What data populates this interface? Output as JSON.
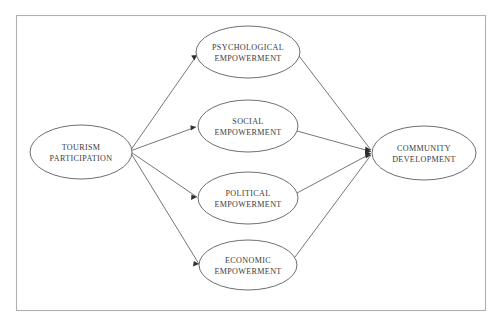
{
  "diagram": {
    "type": "conceptual-path-model",
    "frame": {
      "visible": true,
      "border_color": "#b0b0b0"
    },
    "colors": {
      "background": "#ffffff",
      "node_stroke": "#5d5d5d",
      "link_stroke": "#5d5d5d",
      "arrow_fill": "#2f2f2f",
      "text": "#3b3b3b"
    },
    "nodes": [
      {
        "id": "tourism-participation",
        "role": "independent-variable",
        "line1": "TOURISM",
        "line2": "PARTICIPATION",
        "cx": 81,
        "cy": 152,
        "rx": 51,
        "ry": 27
      },
      {
        "id": "psychological-empowerment",
        "role": "mediator",
        "line1": "PSYCHOLOGICAL",
        "line2": "EMPOWERMENT",
        "cx": 248,
        "cy": 52,
        "rx": 52,
        "ry": 26
      },
      {
        "id": "social-empowerment",
        "role": "mediator",
        "line1": "SOCIAL",
        "line2": "EMPOWERMENT",
        "cx": 248,
        "cy": 126,
        "rx": 50,
        "ry": 26
      },
      {
        "id": "political-empowerment",
        "role": "mediator",
        "line1": "POLITICAL",
        "line2": "EMPOWERMENT",
        "cx": 248,
        "cy": 198,
        "rx": 50,
        "ry": 26
      },
      {
        "id": "economic-empowerment",
        "role": "mediator",
        "line1": "ECONOMIC",
        "line2": "EMPOWERMENT",
        "cx": 248,
        "cy": 265,
        "rx": 49,
        "ry": 25
      },
      {
        "id": "community-development",
        "role": "dependent-variable",
        "line1": "COMMUNITY",
        "line2": "DEVELOPMENT",
        "cx": 424,
        "cy": 153,
        "rx": 52,
        "ry": 27
      }
    ],
    "links": [
      {
        "id": "tp-to-psychological",
        "from": "tourism-participation",
        "to": "psychological-empowerment"
      },
      {
        "id": "tp-to-social",
        "from": "tourism-participation",
        "to": "social-empowerment"
      },
      {
        "id": "tp-to-political",
        "from": "tourism-participation",
        "to": "political-empowerment"
      },
      {
        "id": "tp-to-economic",
        "from": "tourism-participation",
        "to": "economic-empowerment"
      },
      {
        "id": "psychological-to-cd",
        "from": "psychological-empowerment",
        "to": "community-development"
      },
      {
        "id": "social-to-cd",
        "from": "social-empowerment",
        "to": "community-development"
      },
      {
        "id": "political-to-cd",
        "from": "political-empowerment",
        "to": "community-development"
      },
      {
        "id": "economic-to-cd",
        "from": "economic-empowerment",
        "to": "community-development"
      }
    ]
  }
}
